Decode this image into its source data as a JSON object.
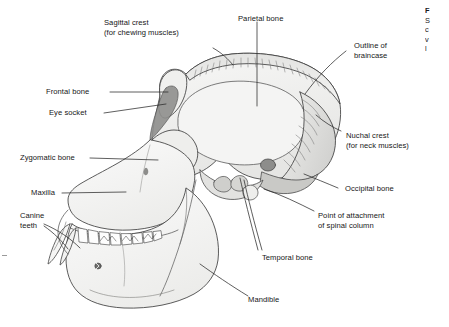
{
  "figure": {
    "background_color": "#ffffff",
    "line_color": "#3a3a3a",
    "fill_light": "#f2f2f1",
    "fill_mid": "#d8d8d6",
    "fill_dark": "#b3b3b1"
  },
  "labels": [
    {
      "id": "sagittal-crest",
      "line1": "Sagittal crest",
      "line2": "(for chewing muscles)"
    },
    {
      "id": "parietal-bone",
      "line1": "Parietal bone",
      "line2": ""
    },
    {
      "id": "outline-of-braincase",
      "line1": "Outline of",
      "line2": "braincase"
    },
    {
      "id": "frontal-bone",
      "line1": "Frontal bone",
      "line2": ""
    },
    {
      "id": "eye-socket",
      "line1": "Eye socket",
      "line2": ""
    },
    {
      "id": "nuchal-crest",
      "line1": "Nuchal crest",
      "line2": "(for neck muscles)"
    },
    {
      "id": "zygomatic-bone",
      "line1": "Zygomatic bone",
      "line2": ""
    },
    {
      "id": "occipital-bone",
      "line1": "Occipital bone",
      "line2": ""
    },
    {
      "id": "maxilla",
      "line1": "Maxilla",
      "line2": ""
    },
    {
      "id": "point-of-attachment",
      "line1": "Point of attachment",
      "line2": "of spinal column"
    },
    {
      "id": "canine-teeth",
      "line1": "Canine",
      "line2": "teeth"
    },
    {
      "id": "temporal-bone",
      "line1": "Temporal bone",
      "line2": ""
    },
    {
      "id": "mandible",
      "line1": "Mandible",
      "line2": ""
    }
  ],
  "caption": {
    "line1": "F",
    "line2": "S",
    "line3": "c",
    "line4": "v",
    "line5": "l"
  }
}
